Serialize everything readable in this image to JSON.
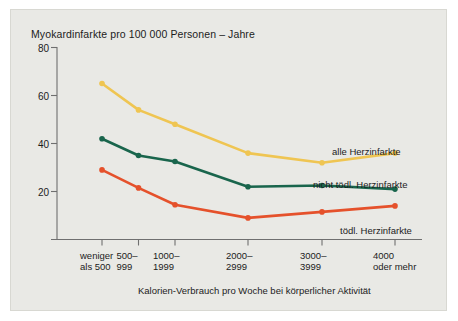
{
  "chart_data": {
    "type": "line",
    "title": "Myokardinfarkte pro 100 000 Personen – Jahre",
    "xlabel": "Kalorien-Verbrauch pro Woche bei körperlicher Aktivität",
    "ylabel": "",
    "categories": [
      "weniger\nals 500",
      "500–\n999",
      "1000–\n1999",
      "2000–\n2999",
      "3000–\n3999",
      "4000\noder mehr"
    ],
    "category_lines": [
      [
        "weniger",
        "als 500"
      ],
      [
        "500–",
        "999"
      ],
      [
        "1000–",
        "1999"
      ],
      [
        "2000–",
        "2999"
      ],
      [
        "3000–",
        "3999"
      ],
      [
        "4000",
        "oder mehr"
      ]
    ],
    "ylim": [
      0,
      80
    ],
    "yticks": [
      20,
      40,
      60,
      80
    ],
    "grid": false,
    "legend_position": "right-inline",
    "series": [
      {
        "name": "alle Herzinfarkte",
        "color": "#efc552",
        "values": [
          65,
          54,
          48,
          36,
          32,
          36
        ]
      },
      {
        "name": "nicht tödl. Herzinfarkte",
        "color": "#19654c",
        "values": [
          42,
          35,
          32.5,
          22,
          22.5,
          21
        ]
      },
      {
        "name": "tödl. Herzinfarkte",
        "color": "#e5512b",
        "values": [
          29,
          21.5,
          14.5,
          9,
          11.5,
          14
        ]
      }
    ]
  },
  "colors": {
    "background": "#e9e9e5",
    "axis": "#6f6f6f",
    "text": "#1c1c1c",
    "yellow": "#efc552",
    "green": "#19654c",
    "red": "#e5512b"
  }
}
